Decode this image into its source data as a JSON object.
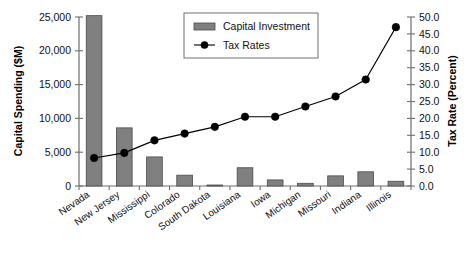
{
  "chart_data": {
    "type": "bar",
    "title": "",
    "subtitle": "",
    "xlabel": "",
    "ylabel": "Capital Spending ($M)",
    "y2label": "Tax Rate (Percent)",
    "grid": false,
    "legend_position": "top-center",
    "categories": [
      "Nevada",
      "New Jersey",
      "Mississippi",
      "Colorado",
      "South Dakota",
      "Louisiana",
      "Iowa",
      "Michigan",
      "Missouri",
      "Indiana",
      "Illinois"
    ],
    "series": [
      {
        "name": "Capital Investment",
        "type": "bar",
        "axis": "left",
        "unit": "$M",
        "color": "#808080",
        "values": [
          25200,
          8600,
          4300,
          1600,
          100,
          2700,
          900,
          400,
          1500,
          2100,
          700
        ]
      },
      {
        "name": "Tax Rates",
        "type": "line",
        "axis": "right",
        "unit": "percent",
        "color": "#000000",
        "values": [
          8.3,
          9.8,
          13.5,
          15.5,
          17.5,
          20.5,
          20.5,
          23.5,
          26.5,
          31.5,
          47.0
        ]
      }
    ],
    "ylim": [
      0,
      25000
    ],
    "yticks": [
      0,
      5000,
      10000,
      15000,
      20000,
      25000
    ],
    "ytick_labels": [
      "0",
      "5,000",
      "10,000",
      "15,000",
      "20,000",
      "25,000"
    ],
    "y2lim": [
      0,
      50
    ],
    "y2ticks": [
      0,
      5,
      10,
      15,
      20,
      25,
      30,
      35,
      40,
      45,
      50
    ],
    "y2tick_labels": [
      "0.0",
      "5.0",
      "10.0",
      "15.0",
      "20.0",
      "25.0",
      "30.0",
      "35.0",
      "40.0",
      "45.0",
      "50.0"
    ],
    "legend": [
      {
        "label": "Capital Investment",
        "marker": "bar-swatch"
      },
      {
        "label": "Tax Rates",
        "marker": "line-dot"
      }
    ]
  }
}
